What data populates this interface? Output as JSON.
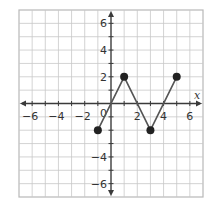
{
  "chart_data": {
    "type": "line",
    "title": "",
    "xlabel": "x",
    "ylabel": "",
    "xlim": [
      -7,
      7
    ],
    "ylim": [
      -7,
      7
    ],
    "grid": true,
    "x_ticks": [
      -6,
      -4,
      -2,
      2,
      4,
      6
    ],
    "y_ticks": [
      6,
      4,
      2,
      -4,
      -6
    ],
    "origin_label": "0",
    "series": [
      {
        "name": "piecewise",
        "points": [
          [
            -1,
            -2
          ],
          [
            1,
            2
          ],
          [
            3,
            -2
          ],
          [
            5,
            2
          ]
        ],
        "markers": "filled"
      }
    ]
  },
  "colors": {
    "grid": "#c8c8c8",
    "axis": "#3a3a3a",
    "line": "#555555",
    "point": "#222222"
  }
}
